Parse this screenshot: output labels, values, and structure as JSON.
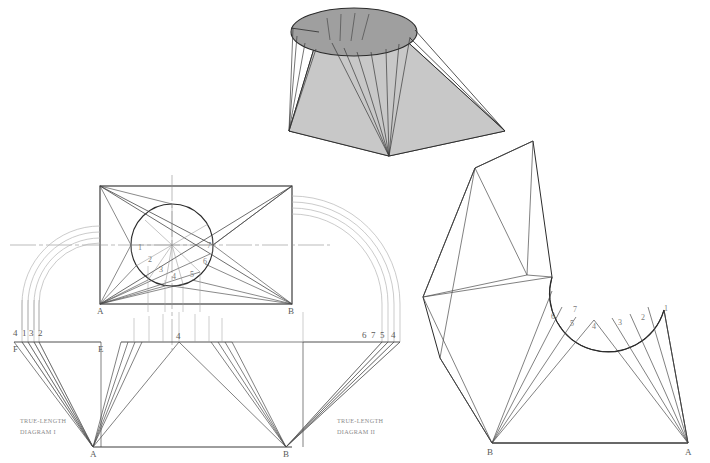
{
  "document": {
    "type": "engineering-drawing",
    "subject": "Rectangle-to-round transition piece development",
    "background_color": "#ffffff"
  },
  "colors": {
    "line_dark": "#2b2b2b",
    "line_mid": "#6b6b6b",
    "line_light": "#a9a9a9",
    "line_faint": "#c6c6c6",
    "solid_fill": "#c8c8c8",
    "top_ellipse_fill": "#9f9f9f",
    "label_text": "#5a5a5a",
    "caption_text": "#8a8a8a"
  },
  "pictorial": {
    "name": "3D pictorial view of transition piece",
    "fill": "#c8c8c8",
    "top_fill": "#9f9f9f"
  },
  "plan_view": {
    "corner_labels": [
      {
        "text": "A",
        "x": 97,
        "y": 314
      },
      {
        "text": "B",
        "x": 288,
        "y": 314
      }
    ],
    "circle_point_numbers": [
      {
        "text": "1",
        "x": 138,
        "y": 250
      },
      {
        "text": "2",
        "x": 148,
        "y": 262
      },
      {
        "text": "3",
        "x": 159,
        "y": 272
      },
      {
        "text": "4",
        "x": 172,
        "y": 279
      },
      {
        "text": "5",
        "x": 190,
        "y": 277
      },
      {
        "text": "6",
        "x": 203,
        "y": 264
      },
      {
        "text": "7",
        "x": 207,
        "y": 248
      }
    ]
  },
  "true_length_diagram_1": {
    "caption_line1": "TRUE-LENGTH",
    "caption_line2": "DIAGRAM  I",
    "point_labels": [
      {
        "text": "4",
        "x": 13,
        "y": 336
      },
      {
        "text": "1",
        "x": 22,
        "y": 336
      },
      {
        "text": "3",
        "x": 29,
        "y": 336
      },
      {
        "text": "2",
        "x": 38,
        "y": 336
      }
    ],
    "base_labels": [
      {
        "text": "F",
        "x": 13,
        "y": 350
      },
      {
        "text": "E",
        "x": 98,
        "y": 350
      },
      {
        "text": "A",
        "x": 93,
        "y": 452
      }
    ]
  },
  "true_length_diagram_2": {
    "caption_line1": "TRUE-LENGTH",
    "caption_line2": "DIAGRAM  II",
    "point_labels": [
      {
        "text": "6",
        "x": 362,
        "y": 336
      },
      {
        "text": "7",
        "x": 371,
        "y": 336
      },
      {
        "text": "5",
        "x": 380,
        "y": 336
      },
      {
        "text": "4",
        "x": 391,
        "y": 336
      }
    ],
    "base_labels": [
      {
        "text": "B",
        "x": 286,
        "y": 452
      }
    ],
    "apex_number": {
      "text": "4",
      "x": 179,
      "y": 331
    }
  },
  "development": {
    "name": "flat pattern development",
    "arc_point_numbers": [
      {
        "text": "1",
        "x": 664,
        "y": 311
      },
      {
        "text": "2",
        "x": 641,
        "y": 320
      },
      {
        "text": "3",
        "x": 618,
        "y": 325
      },
      {
        "text": "4",
        "x": 594,
        "y": 329
      },
      {
        "text": "5",
        "x": 572,
        "y": 326
      },
      {
        "text": "6",
        "x": 553,
        "y": 319
      },
      {
        "text": "7",
        "x": 575,
        "y": 312
      }
    ],
    "corner_labels": [
      {
        "text": "B",
        "x": 489,
        "y": 450
      },
      {
        "text": "A",
        "x": 688,
        "y": 450
      }
    ]
  }
}
